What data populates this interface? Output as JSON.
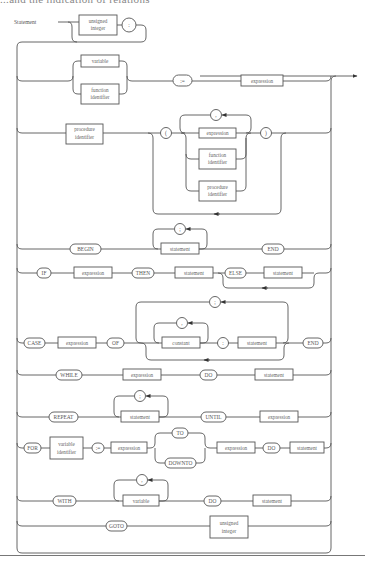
{
  "header": {
    "clipped_text": "...and the indication of relations"
  },
  "diagram": {
    "title": "Statement",
    "rows": [
      {
        "id": "label",
        "nodes": [
          {
            "kind": "box",
            "text": [
              "unsigned",
              "integer"
            ]
          },
          {
            "kind": "circle",
            "text": ":"
          }
        ]
      },
      {
        "id": "assignment",
        "nodes": [
          {
            "kind": "box",
            "text": [
              "variable"
            ]
          },
          {
            "kind": "box",
            "text": [
              "function",
              "identifier"
            ]
          },
          {
            "kind": "round",
            "text": ":="
          },
          {
            "kind": "box",
            "text": [
              "expression"
            ]
          }
        ]
      },
      {
        "id": "procedure-call",
        "nodes": [
          {
            "kind": "box",
            "text": [
              "procedure",
              "identifier"
            ]
          },
          {
            "kind": "circle",
            "text": "("
          },
          {
            "kind": "box",
            "text": [
              "expression"
            ]
          },
          {
            "kind": "box",
            "text": [
              "function",
              "identifier"
            ]
          },
          {
            "kind": "box",
            "text": [
              "procedure",
              "identifier"
            ]
          },
          {
            "kind": "circle",
            "text": ","
          },
          {
            "kind": "circle",
            "text": ")"
          }
        ]
      },
      {
        "id": "compound",
        "nodes": [
          {
            "kind": "round",
            "text": "BEGIN"
          },
          {
            "kind": "box",
            "text": [
              "statement"
            ]
          },
          {
            "kind": "circle",
            "text": ";"
          },
          {
            "kind": "round",
            "text": "END"
          }
        ]
      },
      {
        "id": "if",
        "nodes": [
          {
            "kind": "round",
            "text": "IF"
          },
          {
            "kind": "box",
            "text": [
              "expression"
            ]
          },
          {
            "kind": "round",
            "text": "THEN"
          },
          {
            "kind": "box",
            "text": [
              "statement"
            ]
          },
          {
            "kind": "round",
            "text": "ELSE"
          },
          {
            "kind": "box",
            "text": [
              "statement"
            ]
          }
        ]
      },
      {
        "id": "case",
        "nodes": [
          {
            "kind": "round",
            "text": "CASE"
          },
          {
            "kind": "box",
            "text": [
              "expression"
            ]
          },
          {
            "kind": "round",
            "text": "OF"
          },
          {
            "kind": "box",
            "text": [
              "constant"
            ]
          },
          {
            "kind": "circle",
            "text": ","
          },
          {
            "kind": "circle",
            "text": ":"
          },
          {
            "kind": "box",
            "text": [
              "statement"
            ]
          },
          {
            "kind": "circle",
            "text": ";"
          },
          {
            "kind": "round",
            "text": "END"
          }
        ]
      },
      {
        "id": "while",
        "nodes": [
          {
            "kind": "round",
            "text": "WHILE"
          },
          {
            "kind": "box",
            "text": [
              "expression"
            ]
          },
          {
            "kind": "round",
            "text": "DO"
          },
          {
            "kind": "box",
            "text": [
              "statement"
            ]
          }
        ]
      },
      {
        "id": "repeat",
        "nodes": [
          {
            "kind": "round",
            "text": "REPEAT"
          },
          {
            "kind": "box",
            "text": [
              "statement"
            ]
          },
          {
            "kind": "circle",
            "text": ";"
          },
          {
            "kind": "round",
            "text": "UNTIL"
          },
          {
            "kind": "box",
            "text": [
              "expression"
            ]
          }
        ]
      },
      {
        "id": "for",
        "nodes": [
          {
            "kind": "round",
            "text": "FOR"
          },
          {
            "kind": "box",
            "text": [
              "variable",
              "identifier"
            ]
          },
          {
            "kind": "round",
            "text": ":="
          },
          {
            "kind": "box",
            "text": [
              "expression"
            ]
          },
          {
            "kind": "round",
            "text": "TO"
          },
          {
            "kind": "round",
            "text": "DOWNTO"
          },
          {
            "kind": "box",
            "text": [
              "expression"
            ]
          },
          {
            "kind": "round",
            "text": "DO"
          },
          {
            "kind": "box",
            "text": [
              "statement"
            ]
          }
        ]
      },
      {
        "id": "with",
        "nodes": [
          {
            "kind": "round",
            "text": "WITH"
          },
          {
            "kind": "box",
            "text": [
              "variable"
            ]
          },
          {
            "kind": "circle",
            "text": ","
          },
          {
            "kind": "round",
            "text": "DO"
          },
          {
            "kind": "box",
            "text": [
              "statement"
            ]
          }
        ]
      },
      {
        "id": "goto",
        "nodes": [
          {
            "kind": "round",
            "text": "GOTO"
          },
          {
            "kind": "box",
            "text": [
              "unsigned",
              "integer"
            ]
          }
        ]
      }
    ]
  }
}
